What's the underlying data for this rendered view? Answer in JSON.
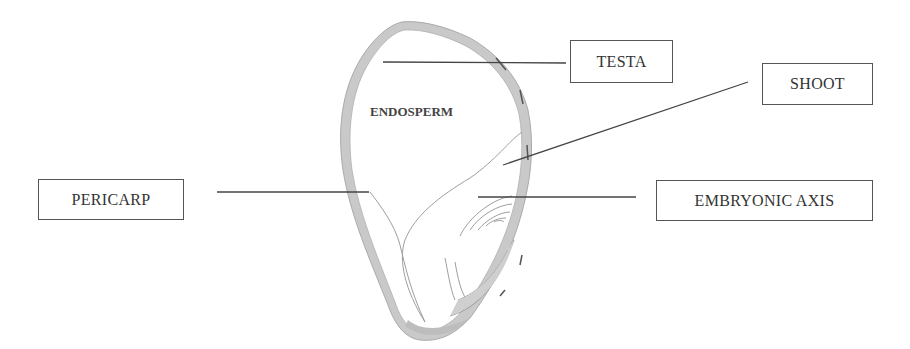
{
  "diagram": {
    "type": "labeled seed cross-section",
    "inner_labels": {
      "endosperm": "ENDOSPERM"
    },
    "labels": [
      {
        "id": "testa",
        "text": "TESTA"
      },
      {
        "id": "shoot",
        "text": "SHOOT"
      },
      {
        "id": "pericarp",
        "text": "PERICARP"
      },
      {
        "id": "embryonic_axis",
        "text": "EMBRYONIC AXIS"
      }
    ],
    "colors": {
      "tissue_fill": "#c8c8c8",
      "outline": "#9a9a9a",
      "leader_line": "#444444",
      "box_border": "#555555",
      "text": "#333333"
    }
  }
}
